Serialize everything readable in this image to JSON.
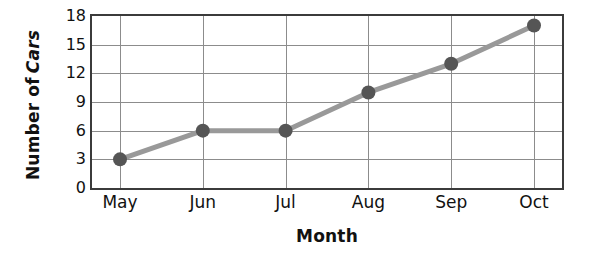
{
  "chart_data": {
    "type": "line",
    "title": "",
    "xlabel": "Month",
    "ylabel": "Number of Cars",
    "categories": [
      "May",
      "Jun",
      "Jul",
      "Aug",
      "Sep",
      "Oct"
    ],
    "values": [
      3,
      6,
      6,
      10,
      13,
      17
    ],
    "series": [
      {
        "name": "Number of Cars",
        "values": [
          3,
          6,
          6,
          10,
          13,
          17
        ]
      }
    ],
    "ylim": [
      0,
      18
    ],
    "y_ticks": [
      0,
      3,
      6,
      9,
      12,
      15,
      18
    ],
    "grid": true,
    "legend": false,
    "legend_position": "none",
    "marker": "circle",
    "colors": {
      "line": "#999999",
      "marker": "#555555",
      "grid": "#8c8c8c",
      "frame": "#3b3b3b",
      "text": "#111111",
      "background": "#ffffff"
    }
  },
  "axis": {
    "y_title_part1": "Number of",
    "y_title_part2": "Cars"
  }
}
